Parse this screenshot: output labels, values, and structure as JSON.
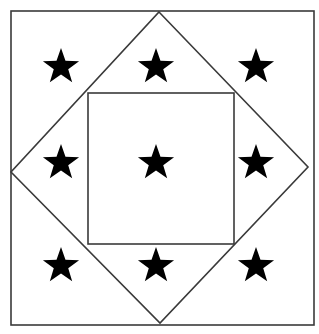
{
  "figure": {
    "shapes": [
      {
        "id": "outer-square",
        "kind": "square"
      },
      {
        "id": "diamond",
        "kind": "rotated-square"
      },
      {
        "id": "inner-square",
        "kind": "square"
      }
    ],
    "stars": [
      {
        "row": 1,
        "col": 1,
        "region": "outer-corner"
      },
      {
        "row": 1,
        "col": 2,
        "region": "diamond-triangle"
      },
      {
        "row": 1,
        "col": 3,
        "region": "outer-corner"
      },
      {
        "row": 2,
        "col": 1,
        "region": "diamond-triangle"
      },
      {
        "row": 2,
        "col": 2,
        "region": "inner-square"
      },
      {
        "row": 2,
        "col": 3,
        "region": "diamond-triangle"
      },
      {
        "row": 3,
        "col": 1,
        "region": "outer-corner"
      },
      {
        "row": 3,
        "col": 2,
        "region": "diamond-triangle"
      },
      {
        "row": 3,
        "col": 3,
        "region": "outer-corner"
      }
    ],
    "star_count": 9,
    "colors": {
      "line": "#3a3a3a",
      "star": "#000000",
      "background": "#ffffff"
    }
  }
}
